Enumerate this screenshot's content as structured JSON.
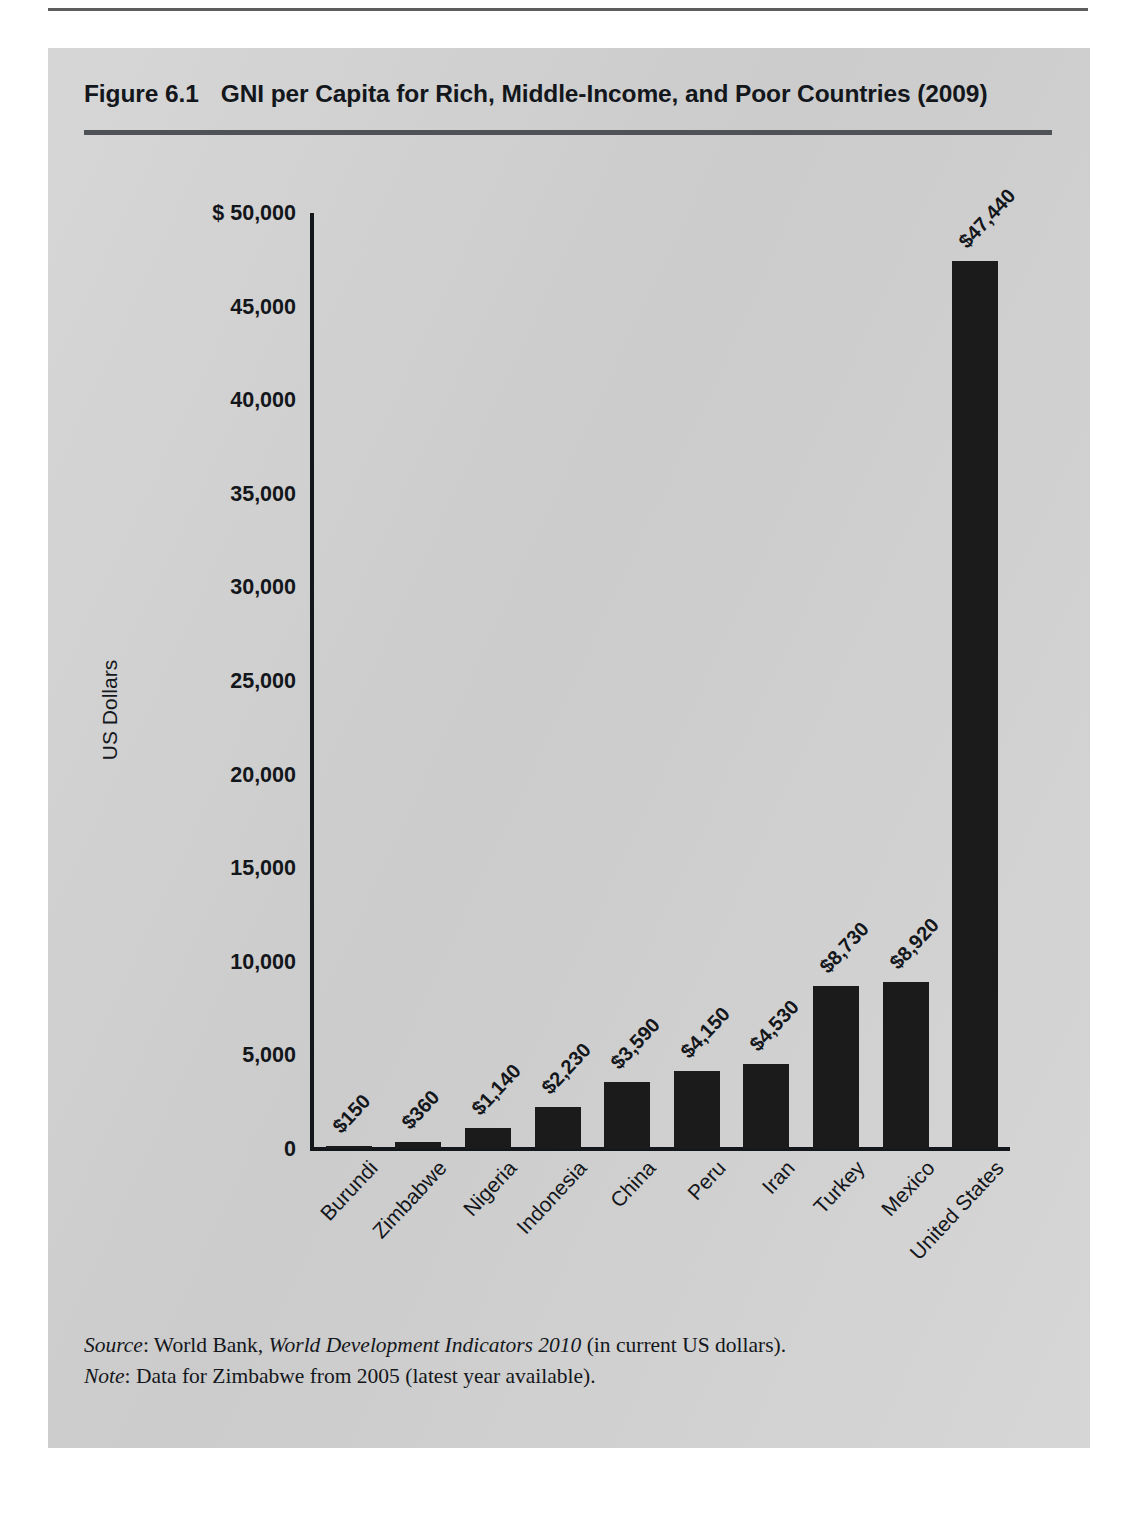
{
  "figure": {
    "number": "Figure 6.1",
    "title": "GNI per Capita for Rich, Middle-Income, and Poor Countries (2009)"
  },
  "notes": {
    "source_label": "Source",
    "source_text": ": World Bank, ",
    "source_italic": "World Development Indicators 2010",
    "source_tail": " (in current US dollars).",
    "note_label": "Note",
    "note_text": ": Data for Zimbabwe from 2005 (latest year available)."
  },
  "chart_data": {
    "type": "bar",
    "title": "GNI per Capita for Rich, Middle-Income, and Poor Countries (2009)",
    "xlabel": "",
    "ylabel": "US Dollars",
    "ylim": [
      0,
      50000
    ],
    "grid": false,
    "legend": null,
    "ytick_labels": [
      "$ 50,000",
      "45,000",
      "40,000",
      "35,000",
      "30,000",
      "25,000",
      "20,000",
      "15,000",
      "10,000",
      "5,000",
      "0"
    ],
    "ytick_values": [
      50000,
      45000,
      40000,
      35000,
      30000,
      25000,
      20000,
      15000,
      10000,
      5000,
      0
    ],
    "categories": [
      "Burundi",
      "Zimbabwe",
      "Nigeria",
      "Indonesia",
      "China",
      "Peru",
      "Iran",
      "Turkey",
      "Mexico",
      "United States"
    ],
    "values": [
      150,
      360,
      1140,
      2230,
      3590,
      4150,
      4530,
      8730,
      8920,
      47440
    ],
    "value_labels": [
      "$150",
      "$360",
      "$1,140",
      "$2,230",
      "$3,590",
      "$4,150",
      "$4,530",
      "$8,730",
      "$8,920",
      "$47,440"
    ],
    "bar_color": "#1b1b1b"
  }
}
